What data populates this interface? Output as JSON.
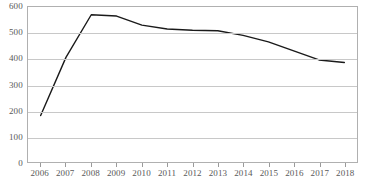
{
  "chart_data": {
    "type": "line",
    "title": "",
    "subtitle": "",
    "xlabel": "",
    "ylabel": "",
    "categories": [
      "2006",
      "2007",
      "2008",
      "2009",
      "2010",
      "2011",
      "2012",
      "2013",
      "2014",
      "2015",
      "2016",
      "2017",
      "2018"
    ],
    "series": [
      {
        "name": "",
        "values": [
          180,
          405,
          570,
          565,
          530,
          515,
          510,
          508,
          490,
          465,
          430,
          395,
          385
        ]
      }
    ],
    "ylim": [
      0,
      600
    ],
    "yticks": [
      0,
      100,
      200,
      300,
      400,
      500,
      600
    ],
    "ytick_labels": [
      "0",
      "100",
      "200",
      "300",
      "400",
      "500",
      "600"
    ],
    "grid": true,
    "grid_axis": "y",
    "legend": false,
    "legend_position": "none",
    "line_color": "#1a1a1a",
    "grid_color": "#c8c8c8",
    "frame_color": "#b0b0b0",
    "tick_label_color": "#595959",
    "background": "#ffffff",
    "markers": false,
    "line_width": 1.4
  }
}
